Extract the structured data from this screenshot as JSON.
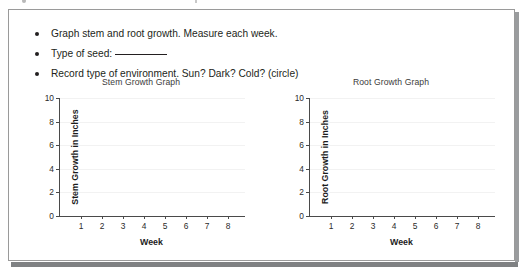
{
  "worksheet": {
    "instructions": [
      "Graph stem and root growth. Measure each week.",
      "Type of seed:",
      "Record type of environment. Sun? Dark? Cold? (circle)"
    ]
  },
  "chart_data": [
    {
      "type": "line",
      "title": "Stem Growth Graph",
      "xlabel": "Week",
      "ylabel": "Stem Growth in Inches",
      "x": [
        1,
        2,
        3,
        4,
        5,
        6,
        7,
        8
      ],
      "xticklabels": [
        "1",
        "2",
        "3",
        "4",
        "5",
        "6",
        "7",
        "8"
      ],
      "yticks": [
        0,
        2,
        4,
        6,
        8,
        10
      ],
      "yticklabels": [
        "0",
        "2",
        "4",
        "6",
        "8",
        "10"
      ],
      "ylim": [
        0,
        10
      ],
      "xlim": [
        0,
        8.8
      ],
      "series": [
        {
          "name": "Stem Growth",
          "values": []
        }
      ],
      "grid": true,
      "legend": false
    },
    {
      "type": "line",
      "title": "Root Growth Graph",
      "xlabel": "Week",
      "ylabel": "Root Growth in Inches",
      "x": [
        1,
        2,
        3,
        4,
        5,
        6,
        7,
        8
      ],
      "xticklabels": [
        "1",
        "2",
        "3",
        "4",
        "5",
        "6",
        "7",
        "8"
      ],
      "yticks": [
        0,
        2,
        4,
        6,
        8,
        10
      ],
      "yticklabels": [
        "0",
        "2",
        "4",
        "6",
        "8",
        "10"
      ],
      "ylim": [
        0,
        10
      ],
      "xlim": [
        0,
        8.8
      ],
      "series": [
        {
          "name": "Root Growth",
          "values": []
        }
      ],
      "grid": true,
      "legend": false
    }
  ]
}
